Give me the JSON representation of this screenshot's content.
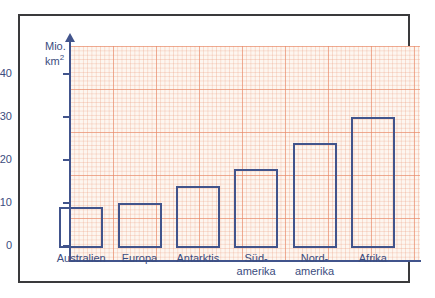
{
  "chart_data": {
    "type": "bar",
    "title": "",
    "xlabel": "",
    "ylabel": "Mio. km²",
    "unit_line1": "Mio.",
    "unit_line2": "km",
    "unit_exponent": "2",
    "categories": [
      "Australien",
      "Europa",
      "Antarktis",
      "Süd-\namerika",
      "Nord-\namerika",
      "Afrika"
    ],
    "values": [
      9,
      10,
      14,
      18,
      24,
      30
    ],
    "ylim": [
      0,
      45
    ],
    "yticks": [
      0,
      10,
      20,
      30,
      40
    ],
    "ytick_labels": [
      "0",
      "10",
      "20",
      "30",
      "40"
    ],
    "grid": true,
    "grid_style": "graph-paper",
    "legend": "none",
    "colors": {
      "bar_outline": "#41548c",
      "bar_fill": "transparent",
      "axis": "#41548c",
      "text": "#3c4d80",
      "grid_major": "#e98968",
      "grid_minor": "#eca082",
      "paper": "#fdf6f0",
      "frame": "#3a3a3c"
    }
  }
}
